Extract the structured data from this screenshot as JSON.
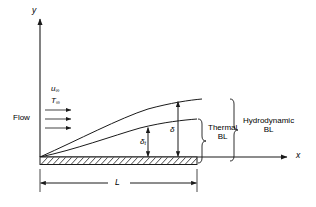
{
  "figure": {
    "stroke_color": "#1a1a1a",
    "background_color": "#ffffff"
  },
  "axes": {
    "y_label": "y",
    "x_label": "x"
  },
  "flow": {
    "label": "Flow",
    "velocity_symbol": "u",
    "velocity_subscript": "∞",
    "temperature_symbol": "T",
    "temperature_subscript": "∞",
    "arrow_count": 3
  },
  "boundary_layers": {
    "thermal": {
      "thickness_symbol": "δ",
      "thickness_subscript": "t",
      "brace_label_line1": "Thermal",
      "brace_label_line2": "BL"
    },
    "hydrodynamic": {
      "thickness_symbol": "δ",
      "thickness_subscript": "",
      "brace_label_line1": "Hydrodynamic",
      "brace_label_line2": "BL"
    }
  },
  "plate": {
    "length_label": "L",
    "hatch_style": "diagonal"
  }
}
